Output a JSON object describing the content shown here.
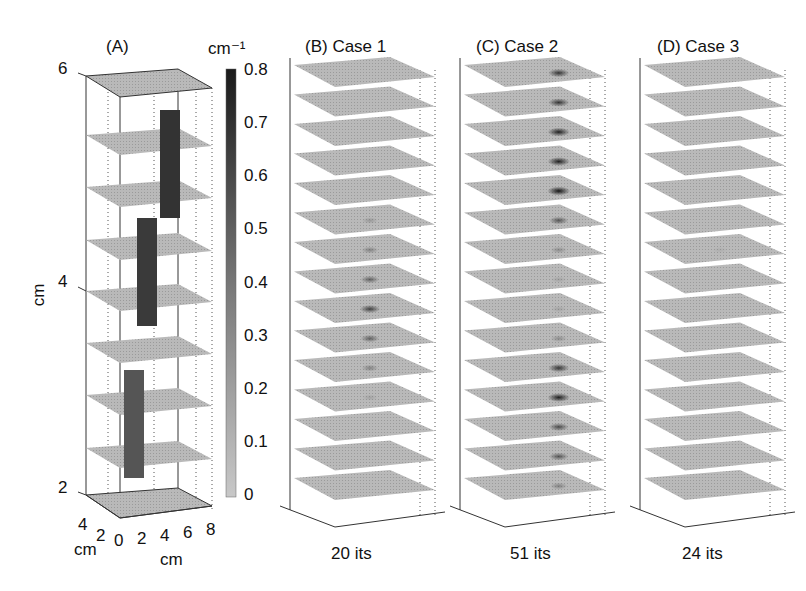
{
  "chart_data": {
    "type": "heatmap",
    "colorbar": {
      "unit_label": "cm⁻¹",
      "ticks": [
        "0.8",
        "0.7",
        "0.6",
        "0.5",
        "0.4",
        "0.3",
        "0.2",
        "0.1",
        "0"
      ],
      "range": [
        0,
        0.8
      ],
      "colormap": "grayscale (light=0, dark=0.8)"
    },
    "panels": [
      {
        "id": "A",
        "title": "(A)",
        "z_label": "cm",
        "z_ticks": [
          "6",
          "4",
          "2"
        ],
        "x_label": "cm",
        "x_ticks": [
          "0",
          "2",
          "4",
          "6",
          "8"
        ],
        "y_label": "cm",
        "y_ticks": [
          "4",
          "2"
        ],
        "content": "True object: three dark rectangular inclusions at different depths"
      },
      {
        "id": "B",
        "title": "(B)  Case 1",
        "iterations_label": "20 its",
        "slices": 15,
        "spot_intensity": [
          0,
          0,
          0,
          0,
          0,
          0.15,
          0.25,
          0.4,
          0.55,
          0.4,
          0.25,
          0.1,
          0,
          0,
          0
        ]
      },
      {
        "id": "C",
        "title": "(C)  Case 2",
        "iterations_label": "51 its",
        "slices": 15,
        "spot_intensity": [
          0.6,
          0.6,
          0.7,
          0.7,
          0.75,
          0.45,
          0.2,
          0.1,
          0.1,
          0.2,
          0.6,
          0.7,
          0.5,
          0.45,
          0.25
        ]
      },
      {
        "id": "D",
        "title": "(D) Case 3",
        "iterations_label": "24 its",
        "slices": 15,
        "spot_intensity": [
          0,
          0,
          0,
          0,
          0,
          0,
          0.05,
          0,
          0,
          0,
          0,
          0,
          0,
          0,
          0
        ]
      }
    ]
  },
  "labels": {
    "panel_a_title": "(A)",
    "panel_b_title": "(B)  Case 1",
    "panel_c_title": "(C)  Case 2",
    "panel_d_title": "(D) Case 3",
    "colorbar_unit": "cm⁻¹",
    "z_axis_label": "cm",
    "x_axis_label": "cm",
    "y_axis_label": "cm",
    "z_tick_6": "6",
    "z_tick_4": "4",
    "z_tick_2": "2",
    "x_tick_0": "0",
    "x_tick_2": "2",
    "x_tick_4": "4",
    "x_tick_6": "6",
    "x_tick_8": "8",
    "y_tick_4": "4",
    "y_tick_2": "2",
    "its_b": "20 its",
    "its_c": "51 its",
    "its_d": "24 its",
    "cb_08": "0.8",
    "cb_07": "0.7",
    "cb_06": "0.6",
    "cb_05": "0.5",
    "cb_04": "0.4",
    "cb_03": "0.3",
    "cb_02": "0.2",
    "cb_01": "0.1",
    "cb_0": "0"
  }
}
